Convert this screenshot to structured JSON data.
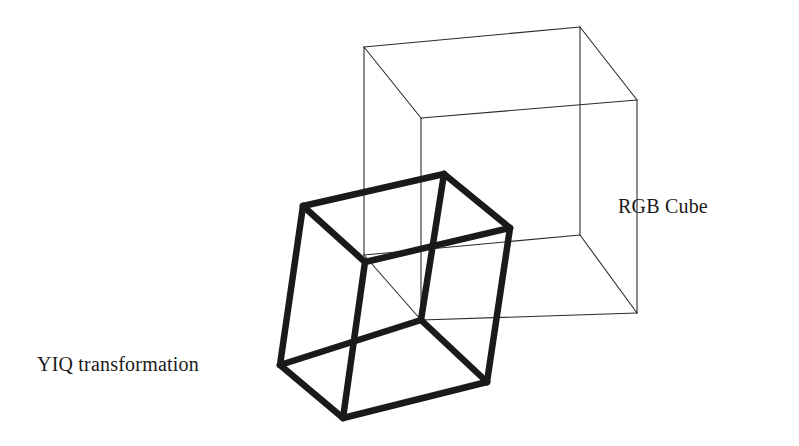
{
  "figure": {
    "background_color": "#ffffff",
    "width": 799,
    "height": 446
  },
  "labels": {
    "rgb_cube": "RGB Cube",
    "yiq_transformation": "YIQ transformation"
  },
  "diagram": {
    "type": "wireframe-cubes",
    "stroke_color_thin": "#2b2b2b",
    "stroke_color_thick": "#1a1a1a",
    "thin_stroke_width": 1.1,
    "thick_stroke_width": 6.5,
    "rgb_cube": {
      "name": "RGB Cube",
      "style": "thin-outline",
      "vertices": {
        "back_top_left": [
          364,
          47
        ],
        "back_top_right": [
          580,
          27
        ],
        "right_top": [
          637,
          100
        ],
        "front_top_inner": [
          421,
          118
        ],
        "back_bottom_left": [
          364,
          255
        ],
        "back_bottom_right": [
          580,
          235
        ],
        "right_bottom": [
          637,
          313
        ],
        "front_bottom_inner": [
          421,
          320
        ]
      },
      "edges": [
        [
          "back_top_left",
          "back_top_right"
        ],
        [
          "back_top_right",
          "right_top"
        ],
        [
          "right_top",
          "front_top_inner"
        ],
        [
          "front_top_inner",
          "back_top_left"
        ],
        [
          "back_bottom_left",
          "back_bottom_right"
        ],
        [
          "back_bottom_right",
          "right_bottom"
        ],
        [
          "right_bottom",
          "front_bottom_inner"
        ],
        [
          "front_bottom_inner",
          "back_bottom_left"
        ],
        [
          "back_top_left",
          "back_bottom_left"
        ],
        [
          "back_top_right",
          "back_bottom_right"
        ],
        [
          "right_top",
          "right_bottom"
        ],
        [
          "front_top_inner",
          "front_bottom_inner"
        ]
      ]
    },
    "yiq_cube": {
      "name": "YIQ transformation",
      "style": "thick-outline",
      "vertices": {
        "top_left": [
          303,
          206
        ],
        "top_back": [
          444,
          174
        ],
        "top_right": [
          510,
          228
        ],
        "top_front_inner": [
          365,
          262
        ],
        "bottom_left": [
          280,
          365
        ],
        "bottom_back_inner": [
          421,
          320
        ],
        "bottom_right": [
          487,
          382
        ],
        "bottom_front": [
          343,
          418
        ]
      },
      "edges": [
        [
          "top_left",
          "top_back"
        ],
        [
          "top_back",
          "top_right"
        ],
        [
          "top_right",
          "top_front_inner"
        ],
        [
          "top_front_inner",
          "top_left"
        ],
        [
          "bottom_left",
          "bottom_back_inner"
        ],
        [
          "bottom_back_inner",
          "bottom_right"
        ],
        [
          "bottom_right",
          "bottom_front"
        ],
        [
          "bottom_front",
          "bottom_left"
        ],
        [
          "top_left",
          "bottom_left"
        ],
        [
          "top_back",
          "bottom_back_inner"
        ],
        [
          "top_right",
          "bottom_right"
        ],
        [
          "top_front_inner",
          "bottom_front"
        ]
      ]
    }
  }
}
